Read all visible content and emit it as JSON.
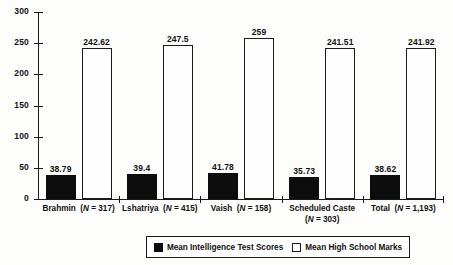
{
  "chart_data": {
    "type": "bar",
    "title": "",
    "subtitle": "",
    "xlabel": "",
    "ylabel": "",
    "ylim": [
      0,
      300
    ],
    "yticks": [
      "0",
      "50",
      "100",
      "150",
      "200",
      "250",
      "300"
    ],
    "grid": false,
    "legend_position": "bottom",
    "categories": [
      "Brahmin",
      "Lshatriya",
      "Vaish",
      "Scheduled Caste",
      "Total"
    ],
    "category_n": [
      "(N = 317)",
      "(N = 415)",
      "(N = 158)",
      "(N = 303)",
      "(N = 1,193)"
    ],
    "series": [
      {
        "name": "Mean Intelligence Test Scores",
        "color": "#0d0d0d",
        "values": [
          38.79,
          39.4,
          41.78,
          35.73,
          38.62
        ],
        "labels": [
          "38.79",
          "39.4",
          "41.78",
          "35.73",
          "38.62"
        ]
      },
      {
        "name": "Mean High School Marks",
        "color": "#ffffff",
        "values": [
          242.62,
          247.5,
          259,
          241.51,
          241.92
        ],
        "labels": [
          "242.62",
          "247.5",
          "259",
          "241.51",
          "241.92"
        ]
      }
    ]
  },
  "legend": {
    "items": [
      {
        "label": "Mean Intelligence Test Scores",
        "swatch": "filled-black-square"
      },
      {
        "label": "Mean High School Marks",
        "swatch": "outlined-white-square"
      }
    ]
  },
  "axis": {
    "n_prefix": "N = ",
    "italic_n": "N"
  }
}
